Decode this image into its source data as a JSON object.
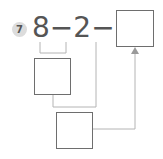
{
  "problem": {
    "number": "7",
    "expression": "8−2−5=",
    "terms": [
      "8",
      "2",
      "5"
    ],
    "operators": [
      "−",
      "−",
      "="
    ]
  },
  "boxes": [
    {
      "name": "answer-box",
      "value": ""
    },
    {
      "name": "step1-box",
      "value": ""
    },
    {
      "name": "step2-box",
      "value": ""
    }
  ],
  "colors": {
    "line": "#b4b4b4",
    "box_border": "#6e6e6e",
    "text": "#555555",
    "badge": "#dcdcdc"
  }
}
